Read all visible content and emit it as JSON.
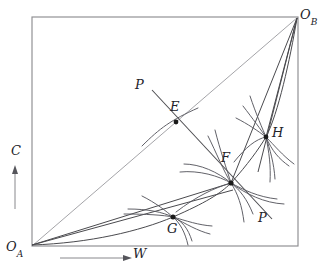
{
  "figure": {
    "type": "edgeworth-box",
    "title_visible": false,
    "background_color": "#ffffff",
    "box": {
      "left": 32,
      "top": 17,
      "right": 298,
      "bottom": 246,
      "stroke_color": "#8d8d91"
    }
  },
  "origins": {
    "lower_left": {
      "label": "O",
      "subscript": "A",
      "x": 32,
      "y": 246
    },
    "upper_right": {
      "label": "O",
      "subscript": "B",
      "x": 298,
      "y": 17
    }
  },
  "axes": {
    "vertical": {
      "label": "C",
      "direction": "up",
      "arrow_from_y": 208,
      "arrow_to_y": 168,
      "x": 15
    },
    "horizontal": {
      "label": "W",
      "direction": "right",
      "arrow_from_x": 60,
      "arrow_to_x": 128,
      "y": 258
    }
  },
  "points": [
    {
      "name": "E",
      "label": "E",
      "x": 176,
      "y": 122,
      "label_x": 170,
      "label_y": 100
    },
    {
      "name": "F",
      "label": "F",
      "x": 231,
      "y": 183,
      "label_x": 221,
      "label_y": 151
    },
    {
      "name": "G",
      "label": "G",
      "x": 173,
      "y": 217,
      "label_x": 167,
      "label_y": 222
    },
    {
      "name": "H",
      "label": "H",
      "x": 266,
      "y": 137,
      "label_x": 272,
      "label_y": 126
    }
  ],
  "lines": {
    "diagonal": {
      "name": "diagonal-OA-OB",
      "from": [
        32,
        246
      ],
      "to": [
        298,
        17
      ],
      "color": "#9a9a9e"
    },
    "price_line": {
      "name": "price-line-PP",
      "label_upper": "P",
      "label_lower": "P",
      "from": [
        152,
        90
      ],
      "to": [
        272,
        219
      ],
      "color": "#4a4a4e"
    }
  },
  "labels": {
    "p_upper": "P",
    "p_lower": "P",
    "c_axis": "C",
    "w_axis": "W"
  },
  "curves": {
    "contract_curve": "passes through O_A, G, F, H, O_B",
    "indifference_curves_at": [
      "E",
      "F",
      "G",
      "H"
    ],
    "rays_from_OA": [
      "to F",
      "to G region"
    ],
    "rays_from_OB": [
      "to F",
      "to H"
    ]
  },
  "colors": {
    "ink": "#23232a",
    "box_stroke": "#8d8d91",
    "diagonal_stroke": "#9a9a9e",
    "curve_stroke": "#595960",
    "point_fill": "#1a1a1a"
  }
}
